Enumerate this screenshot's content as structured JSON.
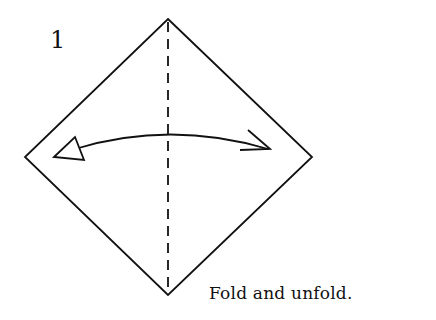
{
  "diagram": {
    "step_number": "1",
    "caption": "Fold and unfold.",
    "colors": {
      "line": "#111111",
      "background": "#ffffff"
    },
    "shape": "square-diamond",
    "fold_line": "vertical-valley-dashed",
    "arrow": "curved-double-headed"
  }
}
